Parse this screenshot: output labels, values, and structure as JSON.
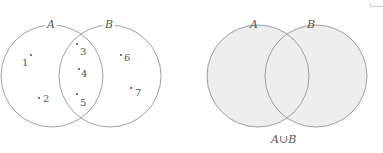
{
  "diagrams": [
    {
      "id": "left",
      "sets": [
        {
          "label": "A",
          "elements_only": [
            "1",
            "2"
          ]
        },
        {
          "label": "B",
          "elements_only": [
            "6",
            "7"
          ]
        }
      ],
      "intersection_elements": [
        "3",
        "4",
        "5"
      ],
      "points": [
        {
          "label": "1",
          "region": "A only"
        },
        {
          "label": "2",
          "region": "A only"
        },
        {
          "label": "3",
          "region": "A and B"
        },
        {
          "label": "4",
          "region": "A and B"
        },
        {
          "label": "5",
          "region": "A and B"
        },
        {
          "label": "6",
          "region": "B only"
        },
        {
          "label": "7",
          "region": "B only"
        }
      ],
      "shaded": false
    },
    {
      "id": "right",
      "sets": [
        {
          "label": "A"
        },
        {
          "label": "B"
        }
      ],
      "shaded": true,
      "shade_color": "#eeeeee",
      "caption": "A∪B"
    }
  ],
  "stroke_color": "#888888"
}
